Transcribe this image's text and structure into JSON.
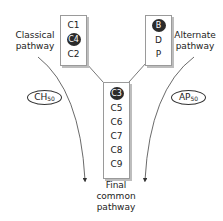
{
  "classical": {
    "label_line1": "Classical",
    "label_line2": "pathway",
    "components": [
      "C1",
      "C4",
      "C2"
    ],
    "highlighted": "C4",
    "assay": "CH",
    "assay_sub": "50"
  },
  "alternate": {
    "label_line1": "Alternate",
    "label_line2": "pathway",
    "components": [
      "B",
      "D",
      "P"
    ],
    "highlighted": "B",
    "assay": "AP",
    "assay_sub": "50"
  },
  "common": {
    "components": [
      "C3",
      "C5",
      "C6",
      "C7",
      "C8",
      "C9"
    ],
    "highlighted": "C3",
    "label_line1": "Final",
    "label_line2": "common",
    "label_line3": "pathway"
  }
}
